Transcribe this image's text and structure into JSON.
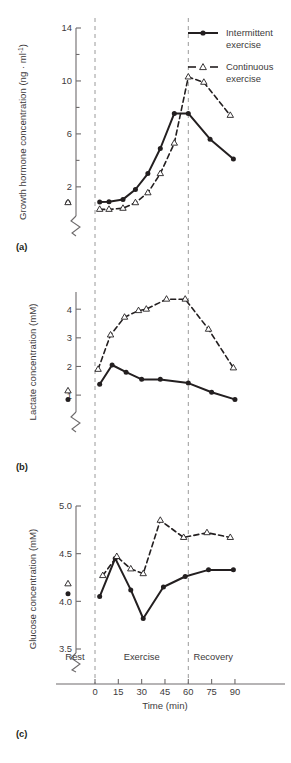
{
  "figure": {
    "panels": [
      {
        "id": "a",
        "label": "(a)",
        "ylabel": "Growth hormone concentration (ng · ml",
        "ylabel_sup": "-1",
        "ylabel_tail": ")"
      },
      {
        "id": "b",
        "label": "(b)",
        "ylabel": "Lactate concentration (mM)"
      },
      {
        "id": "c",
        "label": "(c)",
        "ylabel": "Glucose concentration (mM)"
      }
    ],
    "xlabel": "Time (min)",
    "xticks": [
      "0",
      "15",
      "30",
      "45",
      "60",
      "75",
      "90"
    ],
    "phases": [
      "Rest",
      "Exercise",
      "Recovery"
    ],
    "legend": [
      {
        "name": "Intermittent exercise",
        "line1": "Intermittent",
        "line2": "exercise",
        "marker": "filled-circle",
        "style": "solid"
      },
      {
        "name": "Continuous exercise",
        "line1": "Continuous",
        "line2": "exercise",
        "marker": "open-triangle",
        "style": "dashed"
      }
    ],
    "colors": {
      "ink": "#231f20",
      "text": "#3d3a3b",
      "axis": "#6e6b6c",
      "guide": "#9a9a9a"
    }
  },
  "chart_data": [
    {
      "type": "line",
      "panel": "a",
      "title": "",
      "xlabel": "Time (min)",
      "ylabel": "Growth hormone concentration (ng · ml-1)",
      "yticks": [
        2,
        6,
        10,
        14
      ],
      "yminor": [
        4,
        8,
        12
      ],
      "ylim": [
        0.1,
        14
      ],
      "xlim": [
        0,
        90
      ],
      "axis_break": true,
      "grid": false,
      "legend_position": "top-right",
      "vertical_markers": [
        0,
        60
      ],
      "rest_points": [
        {
          "series": "Intermittent exercise",
          "value": 0.82
        },
        {
          "series": "Continuous exercise",
          "value": 0.42
        }
      ],
      "series": [
        {
          "name": "Intermittent exercise",
          "marker": "filled-circle",
          "style": "solid",
          "x": [
            3,
            9,
            18,
            26,
            34,
            42,
            51,
            60,
            74,
            89
          ],
          "values": [
            0.85,
            0.88,
            1.05,
            1.8,
            3.0,
            4.9,
            7.55,
            7.55,
            5.6,
            4.1
          ]
        },
        {
          "name": "Continuous exercise",
          "marker": "open-triangle",
          "style": "dashed",
          "x": [
            3,
            9,
            18,
            26,
            34,
            42,
            51,
            60,
            70,
            87
          ],
          "values": [
            0.3,
            0.3,
            0.38,
            0.8,
            1.55,
            3.0,
            5.3,
            10.3,
            9.9,
            7.4
          ]
        }
      ]
    },
    {
      "type": "line",
      "panel": "b",
      "title": "",
      "xlabel": "Time (min)",
      "ylabel": "Lactate concentration (mM)",
      "yticks": [
        1,
        2,
        3,
        4
      ],
      "ylim": [
        0.55,
        4.6
      ],
      "xlim": [
        0,
        90
      ],
      "axis_break": true,
      "grid": false,
      "vertical_markers": [
        0,
        60
      ],
      "rest_points": [
        {
          "series": "Intermittent exercise",
          "value": 0.85
        },
        {
          "series": "Continuous exercise",
          "value": 0.97
        }
      ],
      "series": [
        {
          "name": "Intermittent exercise",
          "marker": "filled-circle",
          "style": "solid",
          "x": [
            3,
            11,
            20,
            30,
            42,
            60,
            75,
            90
          ],
          "values": [
            1.38,
            2.05,
            1.8,
            1.55,
            1.55,
            1.42,
            1.1,
            0.85
          ]
        },
        {
          "name": "Continuous exercise",
          "marker": "open-triangle",
          "style": "dashed",
          "x": [
            2,
            10,
            19,
            28,
            33,
            46,
            58,
            73,
            89
          ],
          "values": [
            1.9,
            3.1,
            3.72,
            3.95,
            4.0,
            4.35,
            4.35,
            3.3,
            1.95
          ]
        }
      ]
    },
    {
      "type": "line",
      "panel": "c",
      "title": "",
      "xlabel": "Time (min)",
      "ylabel": "Glucose concentration (mM)",
      "yticks": [
        "3.5",
        "4.0",
        "4.5",
        "5.0"
      ],
      "ytickvals": [
        3.5,
        4.0,
        4.5,
        5.0
      ],
      "ylim": [
        3.5,
        5.0
      ],
      "xlim": [
        0,
        90
      ],
      "axis_break": true,
      "grid": false,
      "vertical_markers": [
        0,
        60
      ],
      "rest_points": [
        {
          "series": "Intermittent exercise",
          "value": 4.08
        },
        {
          "series": "Continuous exercise",
          "value": 4.13
        }
      ],
      "series": [
        {
          "name": "Intermittent exercise",
          "marker": "filled-circle",
          "style": "solid",
          "x": [
            3,
            13,
            23,
            31,
            44,
            58,
            73,
            89
          ],
          "values": [
            4.05,
            4.45,
            4.12,
            3.82,
            4.15,
            4.26,
            4.33,
            4.33
          ]
        },
        {
          "name": "Continuous exercise",
          "marker": "open-triangle",
          "style": "dashed",
          "x": [
            5,
            14,
            23,
            31,
            42,
            57,
            72,
            87
          ],
          "values": [
            4.27,
            4.47,
            4.34,
            4.29,
            4.85,
            4.67,
            4.72,
            4.67
          ]
        }
      ]
    }
  ]
}
